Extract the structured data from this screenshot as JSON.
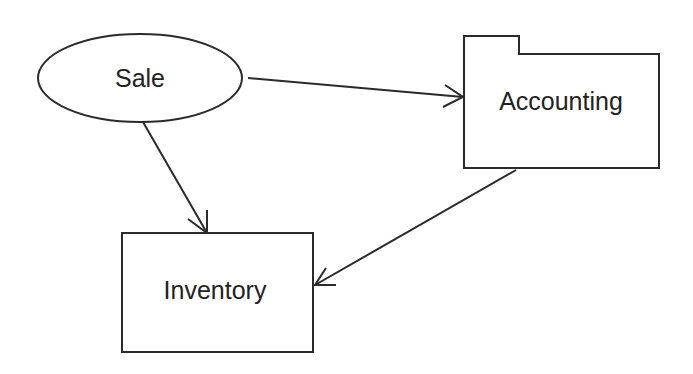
{
  "diagram": {
    "nodes": [
      {
        "id": "sale",
        "label": "Sale",
        "shape": "ellipse"
      },
      {
        "id": "accounting",
        "label": "Accounting",
        "shape": "folder"
      },
      {
        "id": "inventory",
        "label": "Inventory",
        "shape": "rectangle"
      }
    ],
    "edges": [
      {
        "from": "Sale",
        "to": "Accounting",
        "arrow": "open"
      },
      {
        "from": "Sale",
        "to": "Inventory",
        "arrow": "open"
      },
      {
        "from": "Accounting",
        "to": "Inventory",
        "arrow": "open"
      }
    ],
    "colors": {
      "stroke": "#2a2a2a",
      "background": "#ffffff",
      "text": "#222222"
    }
  }
}
